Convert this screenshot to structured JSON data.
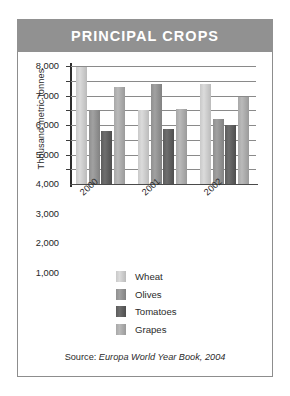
{
  "banner": {
    "title": "PRINCIPAL CROPS"
  },
  "source": {
    "prefix": "Source:",
    "reference": "Europa World Year Book, 2004"
  },
  "legend": {
    "items": [
      {
        "label": "Wheat",
        "color": "#c9c9c9"
      },
      {
        "label": "Olives",
        "color": "#8f8f8f"
      },
      {
        "label": "Tomatoes",
        "color": "#5c5c5c"
      },
      {
        "label": "Grapes",
        "color": "#a8a8a8"
      }
    ]
  },
  "colors": {
    "banner_bg": "#919191",
    "frame": "#8d8d8d",
    "grid": "#8a8a8a",
    "axis": "#2e2e2e",
    "text": "#2b2b2b"
  },
  "chart_data": {
    "type": "bar",
    "title": "PRINCIPAL CROPS",
    "xlabel": "",
    "ylabel": "Thousand metric tonnes",
    "categories": [
      "2000",
      "2001",
      "2002"
    ],
    "ylim": [
      0,
      8000
    ],
    "yticks": [
      1000,
      2000,
      3000,
      4000,
      5000,
      6000,
      7000,
      8000
    ],
    "ytick_labels": [
      "1,000",
      "2,000",
      "3,000",
      "4,000",
      "5,000",
      "6,000",
      "7,000",
      "8,000"
    ],
    "grid": true,
    "legend_position": "below-center",
    "series": [
      {
        "name": "Wheat",
        "color": "#c9c9c9",
        "values": [
          7900,
          5000,
          6800
        ]
      },
      {
        "name": "Olives",
        "color": "#8f8f8f",
        "values": [
          5000,
          6800,
          4400
        ]
      },
      {
        "name": "Tomatoes",
        "color": "#5c5c5c",
        "values": [
          3600,
          3700,
          4000
        ]
      },
      {
        "name": "Grapes",
        "color": "#a8a8a8",
        "values": [
          6600,
          5100,
          5900
        ]
      }
    ],
    "source": "Source: Europa World Year Book, 2004"
  }
}
